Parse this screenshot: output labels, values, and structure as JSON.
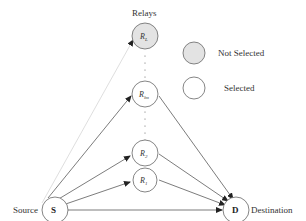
{
  "diagram": {
    "title": "Relays",
    "source": {
      "symbol": "S",
      "label": "Source"
    },
    "destination": {
      "symbol": "D",
      "label": "Destination"
    },
    "relays": [
      {
        "id": "R_L",
        "base": "R",
        "sub": "L",
        "state": "not-selected"
      },
      {
        "id": "R_lm",
        "base": "R",
        "sub": "lm",
        "state": "selected"
      },
      {
        "id": "R_2",
        "base": "R",
        "sub": "2",
        "state": "selected"
      },
      {
        "id": "R_1",
        "base": "R",
        "sub": "1",
        "state": "selected"
      }
    ],
    "legend": {
      "not_selected": "Not Selected",
      "selected": "Selected"
    },
    "colors": {
      "not_selected_fill": "#e3e3e3",
      "selected_fill": "#ffffff",
      "stroke": "#555555",
      "faint_edge": "#d0d0d0"
    }
  }
}
